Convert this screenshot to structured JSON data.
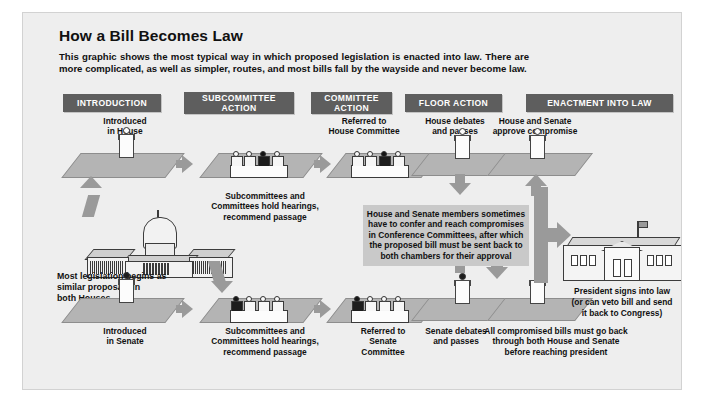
{
  "poster": {
    "title": "How a Bill Becomes Law",
    "intro": "This graphic shows the most typical way in which proposed legislation is enacted into law. There are more complicated, as well as simpler, routes, and most bills fall by the wayside and never become law.",
    "colors": {
      "background": "#eeeeee",
      "header_bar": "#5e5e5e",
      "header_text": "#ffffff",
      "platform": "#b4b4b4",
      "arrow": "#9a9a9a",
      "conference_box": "#c9c9c9",
      "text": "#111111"
    }
  },
  "phases": [
    {
      "label": "INTRODUCTION"
    },
    {
      "label": "SUBCOMMITTEE\nACTION"
    },
    {
      "label": "COMMITTEE\nACTION"
    },
    {
      "label": "FLOOR ACTION"
    },
    {
      "label": "ENACTMENT INTO LAW"
    }
  ],
  "house_track": {
    "step1": "Introduced\nin House",
    "step2": "Subcommittees and\nCommittees hold hearings,\nrecommend passage",
    "step3": "Referred to\nHouse Committee",
    "step4": "House debates\nand passes",
    "step5": "House and Senate\napprove compromise"
  },
  "senate_track": {
    "step1": "Introduced\nin Senate",
    "step2": "Subcommittees and\nCommittees hold hearings,\nrecommend passage",
    "step3": "Referred to\nSenate\nCommittee",
    "step4": "Senate debates\nand passes",
    "step5": "All compromised bills must go back\nthrough both House and Senate\nbefore reaching president"
  },
  "capitol": {
    "caption": "Most legislation begins as\nsimilar proposals in\nboth Houses",
    "icon": "capitol-building-icon"
  },
  "conference": {
    "text": "House and Senate members sometimes have to confer and reach compromises in Conference Committees, after which the proposed bill must be sent back to both chambers for their approval"
  },
  "white_house": {
    "caption": "President signs into law\n(or can veto bill and send\nit back to Congress)",
    "icon": "white-house-icon"
  }
}
